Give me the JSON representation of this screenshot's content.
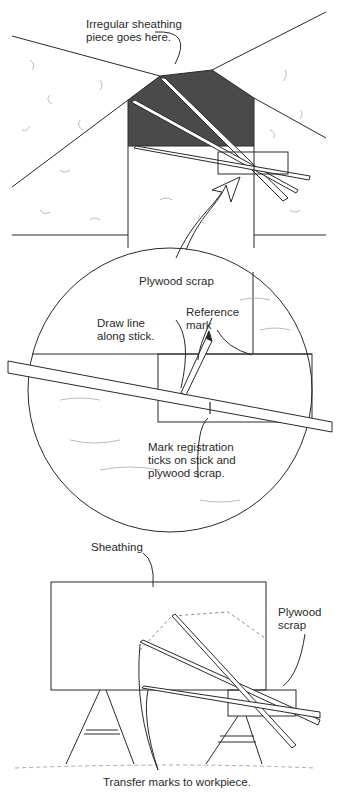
{
  "panels": {
    "top": {
      "label": "Irregular sheathing\npiece goes here."
    },
    "middle": {
      "labels": {
        "plywood_scrap": "Plywood scrap",
        "reference_mark": "Reference\nmark",
        "draw_line": "Draw line\nalong stick.",
        "registration": "Mark registration\nticks on stick and\nplywood scrap."
      }
    },
    "bottom": {
      "labels": {
        "sheathing": "Sheathing",
        "plywood_scrap": "Plywood\nscrap",
        "transfer": "Transfer marks to workpiece."
      }
    }
  },
  "colors": {
    "ink": "#2a2a2a",
    "dark_fill": "#4a4a4a",
    "texture": "#aaaaaa"
  }
}
